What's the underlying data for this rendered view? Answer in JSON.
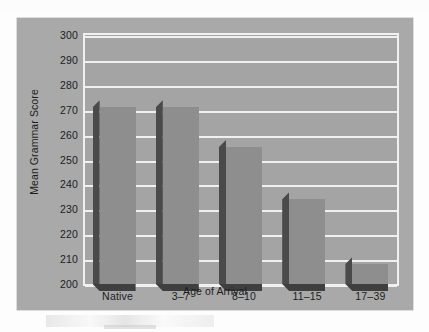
{
  "figure": {
    "panel_background": "#a9a9a9",
    "plot_background": "#a4a4a4",
    "gridline_color": "#f0f0f0",
    "bar_face_color": "#8e8e8e",
    "bar_side_color": "#4a4a4a",
    "bar_shadow_color": "#3f3f3f",
    "text_color": "#1d1d1d"
  },
  "chart_data": {
    "type": "bar",
    "title": "",
    "xlabel": "Age of Arrival",
    "ylabel": "Mean Grammar Score",
    "categories": [
      "Native",
      "3–7",
      "8–10",
      "11–15",
      "17–39"
    ],
    "values": [
      271,
      271,
      255,
      234,
      208
    ],
    "ylim": [
      200,
      300
    ],
    "ytick_step": 10,
    "yticks": [
      300,
      290,
      280,
      270,
      260,
      250,
      240,
      230,
      220,
      210,
      200
    ],
    "ytick_labels": [
      "300",
      "290",
      "280",
      "270",
      "260",
      "250",
      "240",
      "230",
      "220",
      "210",
      "200"
    ],
    "grid": true,
    "grid_axis": "y",
    "legend": null,
    "legend_position": "none",
    "bar_style": "3d-extruded",
    "series": [
      {
        "name": "Mean Grammar Score",
        "values": [
          271,
          271,
          255,
          234,
          208
        ]
      }
    ],
    "annotations": []
  }
}
